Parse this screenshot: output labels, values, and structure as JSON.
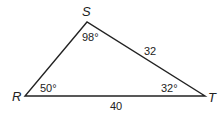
{
  "diagram": {
    "type": "triangle",
    "vertices": [
      {
        "name": "S",
        "x": 87,
        "y": 22
      },
      {
        "name": "R",
        "x": 25,
        "y": 96
      },
      {
        "name": "T",
        "x": 205,
        "y": 96
      }
    ],
    "vertex_labels": {
      "S": "S",
      "R": "R",
      "T": "T"
    },
    "angles": {
      "S": "98°",
      "R": "50°",
      "T": "32°"
    },
    "sides": {
      "ST": "32",
      "RT": "40"
    },
    "line_color": "#222222"
  }
}
